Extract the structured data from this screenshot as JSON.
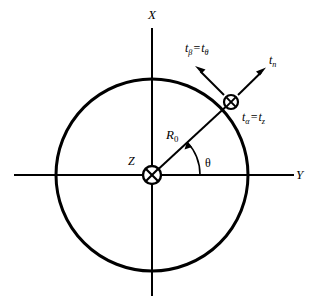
{
  "figure": {
    "background_color": "#ffffff",
    "line_color": "#000000",
    "width": 312,
    "height": 304
  },
  "axes": {
    "vertical": {
      "label": "X",
      "label_x": 152,
      "label_y": 14,
      "x": 152,
      "y_start": 28,
      "y_end": 296
    },
    "horizontal": {
      "label": "Y",
      "label_x": 299,
      "label_y": 175,
      "y": 175,
      "x_start": 14,
      "x_end": 294
    }
  },
  "origin": {
    "label": "Z",
    "label_x": 131,
    "label_y": 163,
    "x": 152,
    "y": 175,
    "marker": "circled-x",
    "marker_radius": 9
  },
  "circle": {
    "center_x": 152,
    "center_y": 175,
    "radius": 96,
    "stroke_width": 3
  },
  "radius_line": {
    "label": "R",
    "label_subscript": "0",
    "label_x": 168,
    "label_y": 135,
    "from_x": 152,
    "from_y": 175,
    "to_x": 231,
    "to_y": 102,
    "angle_deg": 42.8
  },
  "angle_arc": {
    "label": "θ",
    "label_x": 208,
    "label_y": 163,
    "radius": 48,
    "start_deg": 0,
    "end_deg": 42.8
  },
  "point": {
    "x": 231,
    "y": 102,
    "marker": "circled-x",
    "marker_radius": 7,
    "label_prefix": "t",
    "label_sub_1": "α",
    "label_equals": "=",
    "label_sub_2": "z",
    "label_x": 243,
    "label_y": 117
  },
  "vectors": [
    {
      "name": "tangential",
      "label_prefix": "t",
      "label_sub_1": "β",
      "label_equals": "=",
      "label_sub_2": "θ",
      "from_x": 231,
      "from_y": 102,
      "to_x": 196,
      "to_y": 67,
      "label_x": 186,
      "label_y": 48
    },
    {
      "name": "normal",
      "label_prefix": "t",
      "label_sub_1": "n",
      "from_x": 231,
      "from_y": 102,
      "to_x": 266,
      "to_y": 68,
      "label_x": 270,
      "label_y": 60
    }
  ]
}
